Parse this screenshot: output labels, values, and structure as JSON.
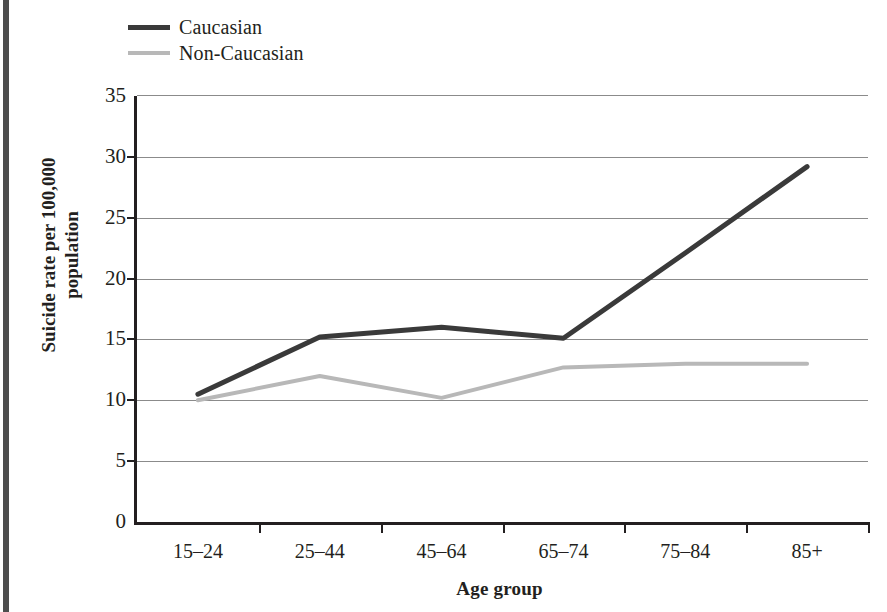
{
  "figure": {
    "axis_title_x": "Age group",
    "axis_title_y": "Suicide rate per 100,000 population",
    "edge_rule_color": "#4d4d4d",
    "axis_color": "#231f20",
    "gridline_color": "#8b8b8b"
  },
  "legend": {
    "position": "top-left",
    "items": [
      {
        "label": "Caucasian",
        "color": "#3a3a3a"
      },
      {
        "label": "Non-Caucasian",
        "color": "#b8b8b8"
      }
    ]
  },
  "chart_data": {
    "type": "line",
    "title": "",
    "subtitle": "",
    "xlabel": "Age group",
    "ylabel": "Suicide rate per 100,000 population",
    "categories": [
      "15–24",
      "25–44",
      "45–64",
      "65–74",
      "75–84",
      "85+"
    ],
    "ylim": [
      0,
      35
    ],
    "yticks": [
      0,
      5,
      10,
      15,
      20,
      25,
      30,
      35
    ],
    "ytick_labels": [
      "0",
      "5",
      "10",
      "15",
      "20",
      "25",
      "30",
      "35"
    ],
    "grid": true,
    "grid_axis": "y",
    "legend_position": "top-left",
    "series": [
      {
        "name": "Caucasian",
        "color": "#3a3a3a",
        "values": [
          10.5,
          15.2,
          16.0,
          15.1,
          22.1,
          29.2
        ]
      },
      {
        "name": "Non-Caucasian",
        "color": "#b8b8b8",
        "values": [
          10.0,
          12.0,
          10.2,
          12.7,
          13.0,
          13.0
        ]
      }
    ]
  }
}
